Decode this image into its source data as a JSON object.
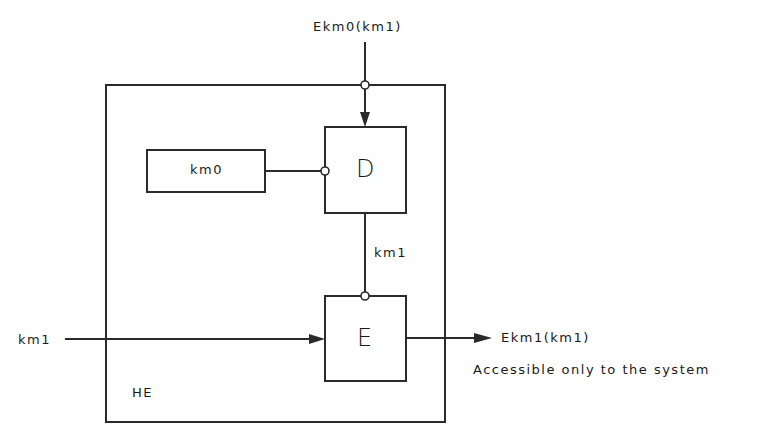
{
  "diagram": {
    "container": {
      "label": "HE"
    },
    "blocks": {
      "key_store": {
        "label": "km0"
      },
      "decrypt": {
        "label": "D"
      },
      "encrypt": {
        "label": "E"
      }
    },
    "signals": {
      "top_input": "Ekm0(km1)",
      "internal": "km1",
      "left_input": "km1",
      "output": "Ekm1(km1)"
    },
    "note": "Accessible only to the system",
    "colors": {
      "line": "#2a2a2a",
      "background": "#ffffff"
    }
  }
}
